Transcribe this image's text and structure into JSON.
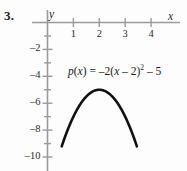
{
  "figure": {
    "problem_number": "3.",
    "background_color": "#fdfdfd",
    "axis_color": "#9a9a9a",
    "curve_color": "#111111",
    "text_color": "#1a1a1a"
  },
  "labels": {
    "x_axis_name": "x",
    "y_axis_name": "y"
  },
  "equation": {
    "full_text": "p(x) = –2(x – 2)² – 5",
    "func_name": "p",
    "open_paren": "(",
    "var1": "x",
    "close_paren_eq": ") = ",
    "coefficient": "–2(",
    "var2": "x",
    "inner": " – 2)",
    "exponent": "2",
    "constant": " – 5"
  },
  "chart_data": {
    "type": "line",
    "title": "",
    "xlabel": "x",
    "ylabel": "y",
    "xlim": [
      -0.6,
      5.2
    ],
    "ylim": [
      -11.0,
      0.6
    ],
    "grid": false,
    "legend": null,
    "x_ticks": [
      1,
      2,
      3,
      4
    ],
    "x_tick_labels": [
      "1",
      "2",
      "3",
      "4"
    ],
    "y_ticks": [
      -2,
      -4,
      -6,
      -8,
      -10
    ],
    "y_tick_labels": [
      "–2",
      "–4",
      "–6",
      "–8",
      "–10"
    ],
    "y_minor_ticks": [
      -1,
      -3,
      -5,
      -7,
      -9
    ],
    "annotations": [
      {
        "text": "p(x) = –2(x – 2)² – 5",
        "x": 1.0,
        "y": -4.0
      }
    ],
    "series": [
      {
        "name": "p(x) = -2(x - 2)^2 - 5",
        "equation": "y = -2*(x-2)^2 - 5",
        "vertex": [
          2,
          -5
        ],
        "a": -2,
        "h": 2,
        "k": -5,
        "x_domain": [
          0.55,
          3.45
        ],
        "points": [
          {
            "x": 0.55,
            "y": -9.21
          },
          {
            "x": 0.75,
            "y": -8.13
          },
          {
            "x": 1.0,
            "y": -7.0
          },
          {
            "x": 1.25,
            "y": -6.13
          },
          {
            "x": 1.5,
            "y": -5.5
          },
          {
            "x": 1.75,
            "y": -5.13
          },
          {
            "x": 2.0,
            "y": -5.0
          },
          {
            "x": 2.25,
            "y": -5.13
          },
          {
            "x": 2.5,
            "y": -5.5
          },
          {
            "x": 2.75,
            "y": -6.13
          },
          {
            "x": 3.0,
            "y": -7.0
          },
          {
            "x": 3.25,
            "y": -8.13
          },
          {
            "x": 3.45,
            "y": -9.21
          }
        ]
      }
    ]
  }
}
